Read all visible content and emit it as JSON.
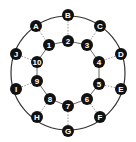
{
  "diagram": {
    "outer_ring": {
      "center": [
        68,
        73
      ],
      "radius": 57,
      "stroke": "#333333"
    },
    "outer_nodes": [
      {
        "id": "A",
        "x": 36,
        "y": 26
      },
      {
        "id": "B",
        "x": 68,
        "y": 15
      },
      {
        "id": "C",
        "x": 100,
        "y": 26
      },
      {
        "id": "D",
        "x": 121,
        "y": 54
      },
      {
        "id": "E",
        "x": 121,
        "y": 89
      },
      {
        "id": "F",
        "x": 100,
        "y": 117
      },
      {
        "id": "G",
        "x": 68,
        "y": 131
      },
      {
        "id": "H",
        "x": 37,
        "y": 117
      },
      {
        "id": "I",
        "x": 16,
        "y": 89
      },
      {
        "id": "J",
        "x": 16,
        "y": 54
      }
    ],
    "inner_nodes": [
      {
        "id": "1",
        "x": 49,
        "y": 45
      },
      {
        "id": "2",
        "x": 68,
        "y": 41
      },
      {
        "id": "3",
        "x": 87,
        "y": 45
      },
      {
        "id": "4",
        "x": 99,
        "y": 62
      },
      {
        "id": "5",
        "x": 99,
        "y": 84
      },
      {
        "id": "6",
        "x": 87,
        "y": 99
      },
      {
        "id": "7",
        "x": 68,
        "y": 106
      },
      {
        "id": "8",
        "x": 50,
        "y": 99
      },
      {
        "id": "9",
        "x": 37,
        "y": 81
      },
      {
        "id": "10",
        "x": 37,
        "y": 62
      }
    ],
    "spokes": [
      [
        "A",
        "1"
      ],
      [
        "B",
        "2"
      ],
      [
        "C",
        "3"
      ],
      [
        "D",
        "4"
      ],
      [
        "E",
        "5"
      ],
      [
        "F",
        "6"
      ],
      [
        "G",
        "7"
      ],
      [
        "H",
        "8"
      ],
      [
        "I",
        "9"
      ],
      [
        "J",
        "10"
      ]
    ],
    "inner_edges": [
      [
        "1",
        "2"
      ],
      [
        "2",
        "3"
      ],
      [
        "3",
        "4"
      ],
      [
        "4",
        "5"
      ],
      [
        "5",
        "6"
      ],
      [
        "6",
        "7"
      ],
      [
        "7",
        "8"
      ],
      [
        "8",
        "9"
      ],
      [
        "9",
        "10"
      ],
      [
        "10",
        "1"
      ]
    ],
    "node_color": "#111111",
    "node_text_color": "#ffffff",
    "node_radius": 6
  }
}
